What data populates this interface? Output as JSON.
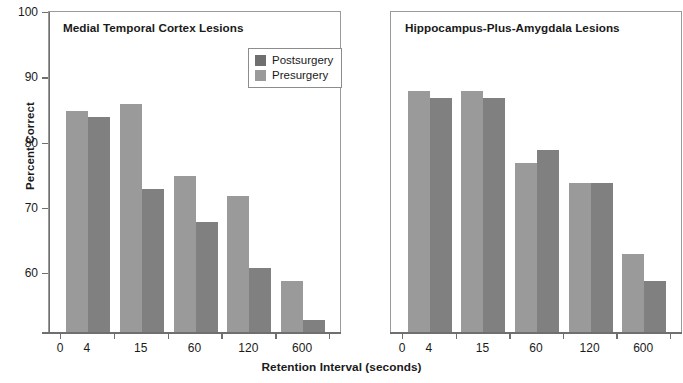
{
  "chart_data": {
    "type": "bar",
    "title": "",
    "xlabel": "Retention Interval (seconds)",
    "ylabel": "Percent Correct",
    "ylim": [
      50,
      100
    ],
    "yticks": [
      60,
      70,
      80,
      90,
      100
    ],
    "ytick_labels": [
      "60",
      "70",
      "80",
      "90",
      "100"
    ],
    "axis_origin_label": "0",
    "grid": false,
    "legend_position": "upper-center-left-panel",
    "categories": [
      "4",
      "15",
      "60",
      "120",
      "600"
    ],
    "panels": [
      {
        "title": "Medial Temporal Cortex Lesions",
        "series": [
          {
            "name": "Presurgery",
            "values": [
              85,
              86,
              75,
              72,
              59
            ]
          },
          {
            "name": "Postsurgery",
            "values": [
              84,
              73,
              68,
              61,
              53
            ]
          }
        ]
      },
      {
        "title": "Hippocampus-Plus-Amygdala Lesions",
        "series": [
          {
            "name": "Presurgery",
            "values": [
              88,
              88,
              77,
              74,
              63
            ]
          },
          {
            "name": "Postsurgery",
            "values": [
              87,
              87,
              79,
              74,
              59
            ]
          }
        ]
      }
    ],
    "legend": [
      {
        "label": "Postsurgery",
        "color": "#6f6f6f"
      },
      {
        "label": "Presurgery",
        "color": "#9a9a9a"
      }
    ],
    "colors": {
      "presurgery": "#9a9a9a",
      "postsurgery": "#808080",
      "axis": "#6f6f6f",
      "panel_border": "#9a9a9a",
      "text": "#1a1a1a",
      "background": "#ffffff"
    }
  }
}
